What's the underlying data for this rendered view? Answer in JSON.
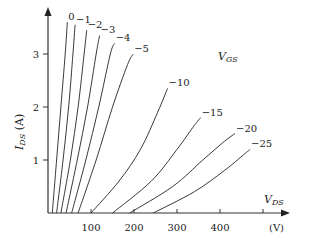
{
  "chart_data": {
    "type": "line",
    "title": "",
    "xlabel": "V_DS",
    "xunit": "(V)",
    "ylabel": "I_DS (A)",
    "legend_title": "V_GS",
    "xlim": [
      0,
      510
    ],
    "ylim": [
      0,
      3.8
    ],
    "x_ticks": [
      100,
      200,
      300,
      400,
      500
    ],
    "x_tick_labels": [
      "100",
      "200",
      "300",
      "400",
      ""
    ],
    "y_ticks": [
      1,
      2,
      3
    ],
    "y_tick_labels": [
      "1",
      "2",
      "3"
    ],
    "grid": false,
    "series": [
      {
        "name": "0",
        "label": "0",
        "points": [
          [
            10,
            0
          ],
          [
            20,
            1.0
          ],
          [
            30,
            2.0
          ],
          [
            40,
            3.0
          ],
          [
            45,
            3.6
          ]
        ]
      },
      {
        "name": "-1",
        "label": "−1",
        "points": [
          [
            20,
            0
          ],
          [
            35,
            1.0
          ],
          [
            48,
            2.0
          ],
          [
            58,
            3.0
          ],
          [
            63,
            3.55
          ]
        ]
      },
      {
        "name": "-2",
        "label": "−2",
        "points": [
          [
            30,
            0
          ],
          [
            52,
            1.0
          ],
          [
            70,
            2.0
          ],
          [
            84,
            3.0
          ],
          [
            90,
            3.45
          ]
        ]
      },
      {
        "name": "-3",
        "label": "−3",
        "points": [
          [
            42,
            0
          ],
          [
            68,
            1.0
          ],
          [
            92,
            2.0
          ],
          [
            112,
            3.0
          ],
          [
            120,
            3.35
          ]
        ]
      },
      {
        "name": "-4",
        "label": "−4",
        "points": [
          [
            55,
            0
          ],
          [
            88,
            1.0
          ],
          [
            118,
            2.0
          ],
          [
            145,
            3.0
          ],
          [
            155,
            3.2
          ]
        ]
      },
      {
        "name": "-5",
        "label": "−5",
        "points": [
          [
            70,
            0
          ],
          [
            112,
            1.0
          ],
          [
            150,
            2.0
          ],
          [
            185,
            2.8
          ],
          [
            198,
            3.0
          ]
        ]
      },
      {
        "name": "-10",
        "label": "−10",
        "points": [
          [
            100,
            0
          ],
          [
            165,
            0.6
          ],
          [
            215,
            1.2
          ],
          [
            255,
            1.9
          ],
          [
            278,
            2.35
          ]
        ]
      },
      {
        "name": "-15",
        "label": "−15",
        "points": [
          [
            150,
            0
          ],
          [
            240,
            0.6
          ],
          [
            300,
            1.2
          ],
          [
            340,
            1.65
          ],
          [
            355,
            1.8
          ]
        ]
      },
      {
        "name": "-20",
        "label": "−20",
        "points": [
          [
            190,
            0
          ],
          [
            290,
            0.5
          ],
          [
            360,
            1.0
          ],
          [
            410,
            1.35
          ],
          [
            435,
            1.5
          ]
        ]
      },
      {
        "name": "-25",
        "label": "−25",
        "points": [
          [
            245,
            0
          ],
          [
            340,
            0.4
          ],
          [
            410,
            0.8
          ],
          [
            455,
            1.1
          ],
          [
            470,
            1.2
          ]
        ]
      }
    ]
  }
}
